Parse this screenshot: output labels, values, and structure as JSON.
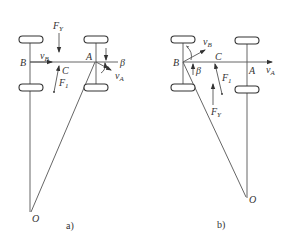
{
  "figure": {
    "panels": [
      {
        "id": "a",
        "caption": "a)",
        "labels": {
          "B": "B",
          "A": "A",
          "C": "C",
          "O": "O",
          "vB": "v",
          "vB_sub": "B",
          "vA": "v",
          "vA_sub": "A",
          "Fy": "F",
          "Fy_sub": "Y",
          "F1": "F",
          "F1_sub": "1",
          "beta": "β"
        }
      },
      {
        "id": "b",
        "caption": "b)",
        "labels": {
          "B": "B",
          "A": "A",
          "C": "C",
          "O": "O",
          "vB": "v",
          "vB_sub": "B",
          "vA": "v",
          "vA_sub": "A",
          "Fy": "F",
          "Fy_sub": "Y",
          "F1": "F",
          "F1_sub": "1",
          "beta": "β"
        }
      }
    ]
  }
}
